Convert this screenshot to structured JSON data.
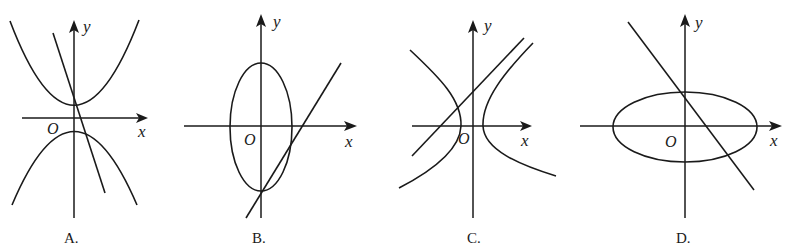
{
  "figures": [
    {
      "id": "A",
      "option_label": "A.",
      "x_label": "x",
      "y_label": "y",
      "origin_label": "O",
      "description": "Two parabolas (one opening up, one opening down) and a steep decreasing line"
    },
    {
      "id": "B",
      "option_label": "B.",
      "x_label": "x",
      "y_label": "y",
      "origin_label": "O",
      "description": "Vertical ellipse centered at origin and an increasing line through the ellipse's bottom vertex"
    },
    {
      "id": "C",
      "option_label": "C.",
      "x_label": "x",
      "y_label": "y",
      "origin_label": "O",
      "description": "Horizontal hyperbola centered at origin and an increasing line"
    },
    {
      "id": "D",
      "option_label": "D.",
      "x_label": "x",
      "y_label": "y",
      "origin_label": "O",
      "description": "Horizontal ellipse centered at origin and a decreasing line through the ellipse's top vertex"
    }
  ]
}
